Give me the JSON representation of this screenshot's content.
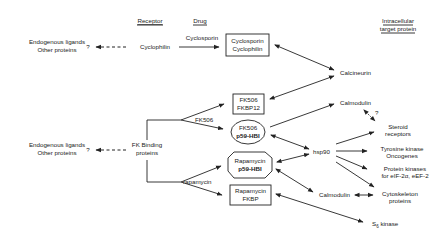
{
  "headers": {
    "receptor": "Receptor",
    "drug": "Drug",
    "target_line1": "Intracellular",
    "target_line2": "target protein"
  },
  "left": {
    "top": {
      "line1": "Endogenous ligands",
      "line2": "Other proteins",
      "question": "?"
    },
    "bottom": {
      "line1": "Endogenous ligands",
      "line2": "Other proteins",
      "question": "?"
    }
  },
  "receptors": {
    "cyclophilin": "Cyclophilin",
    "fkbp_line1": "FK Binding",
    "fkbp_line2": "proteins"
  },
  "drugs": {
    "cyclosporin": "Cyclosporin",
    "fk506": "FK506",
    "rapamycin": "rapamycin"
  },
  "complexes": {
    "cyclo": {
      "line1": "Cyclosporin",
      "line2": "Cyclophilin"
    },
    "fk_fkbp12": {
      "line1": "FK506",
      "line2": "FKBP12"
    },
    "fk_p59": {
      "line1": "FK506",
      "line2": "p59-HBI"
    },
    "rapa_p59": {
      "line1": "Rapamycin",
      "line2": "p59-HBI"
    },
    "rapa_fkbp": {
      "line1": "Rapamycin",
      "line2": "FKBP"
    }
  },
  "targets": {
    "calcineurin": "Calcineurin",
    "calmodulin_top": "Calmodulin",
    "calmodulin_q": "?",
    "steroid_line1": "Steroid",
    "steroid_line2": "receptors",
    "hsp90": "hsp90",
    "tyrosine_line1": "Tyrosine kinase",
    "tyrosine_line2": "Oncogenes",
    "pk_line1": "Protein kinases",
    "pk_line2": "for eIF-2α, eEF-2",
    "calmodulin_bottom": "Calmodulin",
    "cyto_line1": "Cytoskeleton",
    "cyto_line2": "proteins",
    "s6_main": "S",
    "s6_sub": "6",
    "s6_rest": " kinase"
  }
}
